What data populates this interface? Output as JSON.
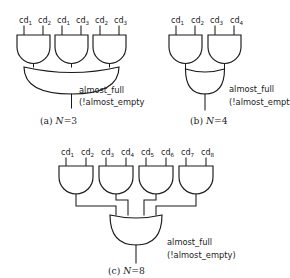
{
  "figure": {
    "background_color": "#ffffff",
    "line_color": "#1a1a1a",
    "panels": [
      {
        "id": "panel-a",
        "caption_tag": "(a)",
        "caption_var": "N",
        "caption_eq": "=3",
        "caption_text": "(a)  N=3",
        "n_value": 3,
        "gate_count_level1": 3,
        "gate_type_level1": "AND",
        "gate_type_level2": "OR",
        "inputs": [
          {
            "base": "cd",
            "sub": "1",
            "text": "cd1"
          },
          {
            "base": "cd",
            "sub": "2",
            "text": "cd2"
          },
          {
            "base": "cd",
            "sub": "1",
            "text": "cd1"
          },
          {
            "base": "cd",
            "sub": "3",
            "text": "cd3"
          },
          {
            "base": "cd",
            "sub": "2",
            "text": "cd2"
          },
          {
            "base": "cd",
            "sub": "3",
            "text": "cd3"
          }
        ],
        "output_line1": "almost_full",
        "output_line2": "(!almost_empty)"
      },
      {
        "id": "panel-b",
        "caption_tag": "(b)",
        "caption_var": "N",
        "caption_eq": "=4",
        "caption_text": "(b)  N=4",
        "n_value": 4,
        "gate_count_level1": 2,
        "gate_type_level1": "AND",
        "gate_type_level2": "OR",
        "inputs": [
          {
            "base": "cd",
            "sub": "1",
            "text": "cd1"
          },
          {
            "base": "cd",
            "sub": "2",
            "text": "cd2"
          },
          {
            "base": "cd",
            "sub": "3",
            "text": "cd3"
          },
          {
            "base": "cd",
            "sub": "4",
            "text": "cd4"
          }
        ],
        "output_line1": "almost_full",
        "output_line2": "(!almost_empty)"
      },
      {
        "id": "panel-c",
        "caption_tag": "(c)",
        "caption_var": "N",
        "caption_eq": "=8",
        "caption_text": "(c)  N=8",
        "n_value": 8,
        "gate_count_level1": 4,
        "gate_type_level1": "AND",
        "gate_type_level2": "OR",
        "inputs": [
          {
            "base": "cd",
            "sub": "1",
            "text": "cd1"
          },
          {
            "base": "cd",
            "sub": "2",
            "text": "cd2"
          },
          {
            "base": "cd",
            "sub": "3",
            "text": "cd3"
          },
          {
            "base": "cd",
            "sub": "4",
            "text": "cd4"
          },
          {
            "base": "cd",
            "sub": "5",
            "text": "cd5"
          },
          {
            "base": "cd",
            "sub": "6",
            "text": "cd6"
          },
          {
            "base": "cd",
            "sub": "7",
            "text": "cd7"
          },
          {
            "base": "cd",
            "sub": "8",
            "text": "cd8"
          }
        ],
        "output_line1": "almost_full",
        "output_line2": "(!almost_empty)"
      }
    ]
  }
}
